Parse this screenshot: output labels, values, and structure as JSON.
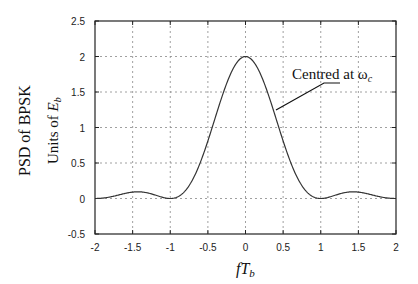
{
  "chart_data": {
    "type": "line",
    "title": "",
    "xlabel": "fT_b",
    "xlabel_parts": {
      "main": "fT",
      "sub": "b"
    },
    "ylabel_outer": "PSD of BPSK",
    "ylabel_inner": "Units of E_b",
    "ylabel_inner_parts": {
      "prefix": "Units of ",
      "main": "E",
      "sub": "b"
    },
    "xlim": [
      -2,
      2
    ],
    "ylim": [
      -0.5,
      2.5
    ],
    "grid": true,
    "xticks": [
      "-2",
      "-1.5",
      "-1",
      "-0.5",
      "0",
      "0.5",
      "1",
      "1.5",
      "2"
    ],
    "yticks": [
      "-0.5",
      "0",
      "0.5",
      "1",
      "1.5",
      "2",
      "2.5"
    ],
    "series": [
      {
        "name": "BPSK PSD",
        "formula": "2*sinc^2(fT_b)",
        "x": [
          -2,
          -1.75,
          -1.5,
          -1.43,
          -1.25,
          -1,
          -0.75,
          -0.5,
          -0.25,
          0,
          0.25,
          0.5,
          0.75,
          1,
          1.25,
          1.43,
          1.5,
          1.75,
          2
        ],
        "y": [
          0,
          0.033,
          0.09,
          0.094,
          0.065,
          0,
          0.36,
          0.81,
          1.62,
          2,
          1.62,
          0.81,
          0.36,
          0,
          0.065,
          0.094,
          0.09,
          0.033,
          0
        ]
      }
    ],
    "annotations": [
      {
        "text": "Centred at ω_c",
        "main": "Centred at ω",
        "sub": "c",
        "points_to": [
          0.42,
          1.23
        ]
      }
    ],
    "legend": null
  }
}
